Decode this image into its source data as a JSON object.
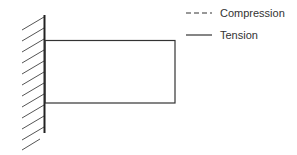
{
  "diagram": {
    "colors": {
      "line": "#333333",
      "hatch": "#555555"
    },
    "wall": {
      "x": 44.5,
      "y_top": 14,
      "y_bottom": 133
    },
    "beam": {
      "x_left": 44.5,
      "x_right": 175,
      "y_top": 40,
      "y_bottom": 103
    }
  },
  "legend": {
    "items": [
      {
        "label": "Compression",
        "style": "dashed"
      },
      {
        "label": "Tension",
        "style": "solid"
      }
    ]
  }
}
